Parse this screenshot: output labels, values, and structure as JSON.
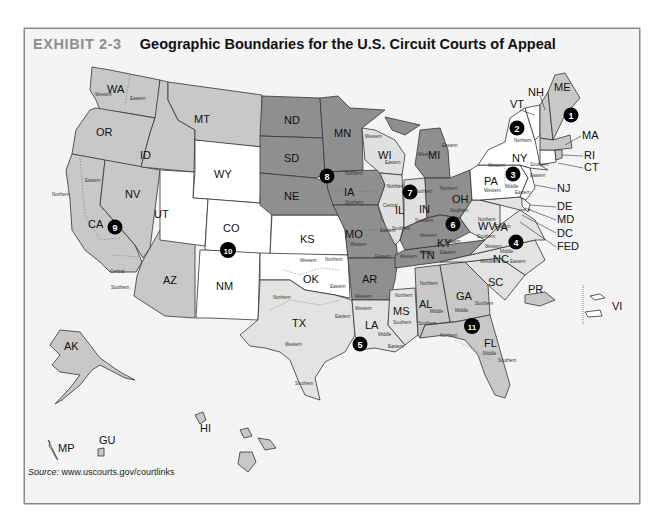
{
  "exhibit": {
    "label": "EXHIBIT 2-3",
    "title": "Geographic Boundaries for the U.S. Circuit Courts of Appeal"
  },
  "source": {
    "prefix": "Source:",
    "url": "www.uscourts.gov/courtlinks"
  },
  "colors": {
    "frame_bg": "#f4f4f4",
    "white_states": "#ffffff",
    "light_gray": "#e3e3e3",
    "mid_gray": "#c8c8c8",
    "dark_gray": "#8f8f8f",
    "marker": "#000000"
  },
  "map": {
    "states": [
      "WA",
      "OR",
      "CA",
      "NV",
      "ID",
      "MT",
      "AZ",
      "AK",
      "HI",
      "GU",
      "MP",
      "WY",
      "UT",
      "CO",
      "NM",
      "KS",
      "OK",
      "ND",
      "SD",
      "NE",
      "MN",
      "IA",
      "MO",
      "AR",
      "WI",
      "IL",
      "IN",
      "MI",
      "OH",
      "KY",
      "TN",
      "TX",
      "LA",
      "MS",
      "AL",
      "GA",
      "FL",
      "SC",
      "NC",
      "VA",
      "WV",
      "MD",
      "DE",
      "PA",
      "NJ",
      "NY",
      "CT",
      "VT",
      "RI",
      "MA",
      "NH",
      "ME",
      "PR",
      "VI",
      "DC",
      "FED"
    ],
    "circuits": [
      {
        "number": "1",
        "states": [
          "ME",
          "NH",
          "MA",
          "RI",
          "PR"
        ]
      },
      {
        "number": "2",
        "states": [
          "NY",
          "VT",
          "CT"
        ]
      },
      {
        "number": "3",
        "states": [
          "PA",
          "NJ",
          "DE",
          "VI"
        ]
      },
      {
        "number": "4",
        "states": [
          "MD",
          "VA",
          "WV",
          "NC",
          "SC"
        ]
      },
      {
        "number": "5",
        "states": [
          "TX",
          "LA",
          "MS"
        ]
      },
      {
        "number": "6",
        "states": [
          "OH",
          "MI",
          "KY",
          "TN"
        ]
      },
      {
        "number": "7",
        "states": [
          "WI",
          "IL",
          "IN"
        ]
      },
      {
        "number": "8",
        "states": [
          "ND",
          "SD",
          "NE",
          "MN",
          "IA",
          "MO",
          "AR"
        ]
      },
      {
        "number": "9",
        "states": [
          "WA",
          "OR",
          "CA",
          "NV",
          "ID",
          "MT",
          "AZ",
          "AK",
          "HI",
          "GU",
          "MP"
        ]
      },
      {
        "number": "10",
        "states": [
          "WY",
          "UT",
          "CO",
          "NM",
          "KS",
          "OK"
        ]
      },
      {
        "number": "11",
        "states": [
          "AL",
          "GA",
          "FL"
        ]
      }
    ],
    "district_labels": [
      "Western",
      "Eastern",
      "Northern",
      "Eastern",
      "Central",
      "Southern",
      "Western",
      "Eastern",
      "Northern",
      "Southern",
      "Northern",
      "Central",
      "Southern",
      "Northern",
      "Southern",
      "Western",
      "Eastern",
      "Northern",
      "Southern",
      "Western",
      "Eastern",
      "Northern",
      "Southern",
      "Western",
      "Eastern",
      "Middle",
      "Eastern",
      "Western",
      "Northern",
      "Western",
      "Eastern",
      "Southern",
      "Western",
      "Northern",
      "Eastern",
      "Western",
      "Eastern",
      "Western",
      "Middle",
      "Eastern",
      "Northern",
      "Southern",
      "Middle",
      "Eastern",
      "Western",
      "Eastern",
      "Middle",
      "Western",
      "Northern",
      "Southern",
      "Western",
      "Middle",
      "Eastern",
      "Northern",
      "Southern",
      "Northern",
      "Middle",
      "Southern",
      "Middle",
      "Southern",
      "Northern",
      "Middle",
      "Southern",
      "Western",
      "Northern",
      "Western",
      "Eastern",
      "Western",
      "Middle",
      "Eastern",
      "Western",
      "Southern",
      "Eastern",
      "Middle",
      "Western"
    ]
  }
}
